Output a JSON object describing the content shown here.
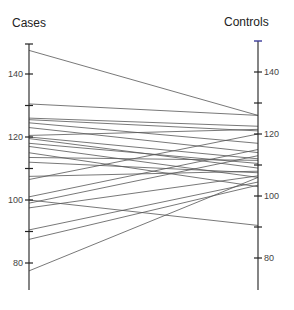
{
  "chart_data": {
    "type": "line",
    "subtype": "paired-slopegraph",
    "title": "",
    "left_axis": {
      "label": "Cases",
      "ticks": [
        80,
        100,
        120,
        140
      ],
      "minor_ticks": [
        90,
        110,
        130,
        150
      ],
      "range": [
        69,
        150
      ]
    },
    "right_axis": {
      "label": "Controls",
      "ticks": [
        80,
        100,
        120,
        140
      ],
      "minor_ticks": [
        90,
        110,
        130,
        150
      ],
      "range": [
        69,
        150
      ]
    },
    "xlabel": "",
    "ylabel": "",
    "grid": false,
    "legend": null,
    "pairs": [
      {
        "cases": 147.5,
        "controls": 126
      },
      {
        "cases": 130.5,
        "controls": 126
      },
      {
        "cases": 126,
        "controls": 122.5
      },
      {
        "cases": 125.5,
        "controls": 121
      },
      {
        "cases": 124.5,
        "controls": 117
      },
      {
        "cases": 123,
        "controls": 114
      },
      {
        "cases": 120.5,
        "controls": 121.5
      },
      {
        "cases": 120,
        "controls": 112
      },
      {
        "cases": 119.5,
        "controls": 109
      },
      {
        "cases": 118,
        "controls": 110.5
      },
      {
        "cases": 117,
        "controls": 106
      },
      {
        "cases": 115,
        "controls": 103
      },
      {
        "cases": 113.5,
        "controls": 111.5
      },
      {
        "cases": 112,
        "controls": 107.5
      },
      {
        "cases": 107.5,
        "controls": 108
      },
      {
        "cases": 106.5,
        "controls": 120
      },
      {
        "cases": 101,
        "controls": 115
      },
      {
        "cases": 100,
        "controls": 90.5
      },
      {
        "cases": 99,
        "controls": 113
      },
      {
        "cases": 97.5,
        "controls": 106.5
      },
      {
        "cases": 90.5,
        "controls": 104.5
      },
      {
        "cases": 87.5,
        "controls": 103.5
      },
      {
        "cases": 77.5,
        "controls": 106
      }
    ]
  },
  "labels": {
    "left": "Cases",
    "right": "Controls"
  }
}
